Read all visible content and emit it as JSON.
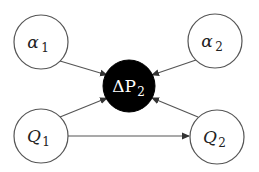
{
  "diagram": {
    "nodes": [
      {
        "id": "alpha1",
        "symbol": "α",
        "subscript": "1",
        "fill": "#ffffff",
        "cx": 41,
        "cy": 42,
        "r": 27
      },
      {
        "id": "alpha2",
        "symbol": "α",
        "subscript": "2",
        "fill": "#ffffff",
        "cx": 215,
        "cy": 41,
        "r": 27
      },
      {
        "id": "Q1",
        "symbol": "Q",
        "subscript": "1",
        "fill": "#ffffff",
        "cx": 41,
        "cy": 136,
        "r": 27
      },
      {
        "id": "Q2",
        "symbol": "Q",
        "subscript": "2",
        "fill": "#ffffff",
        "cx": 217,
        "cy": 137,
        "r": 27
      },
      {
        "id": "deltaP2",
        "symbol": "ΔP",
        "subscript": "2",
        "fill": "#000000",
        "cx": 129,
        "cy": 86,
        "r": 26
      }
    ],
    "edges": [
      {
        "from": "alpha1",
        "to": "deltaP2"
      },
      {
        "from": "alpha2",
        "to": "deltaP2"
      },
      {
        "from": "Q1",
        "to": "deltaP2"
      },
      {
        "from": "Q2",
        "to": "deltaP2"
      },
      {
        "from": "Q1",
        "to": "Q2"
      }
    ],
    "colors": {
      "stroke": "#555555",
      "arrow": "#333333",
      "center_fill": "#000000",
      "node_fill": "#ffffff"
    }
  }
}
